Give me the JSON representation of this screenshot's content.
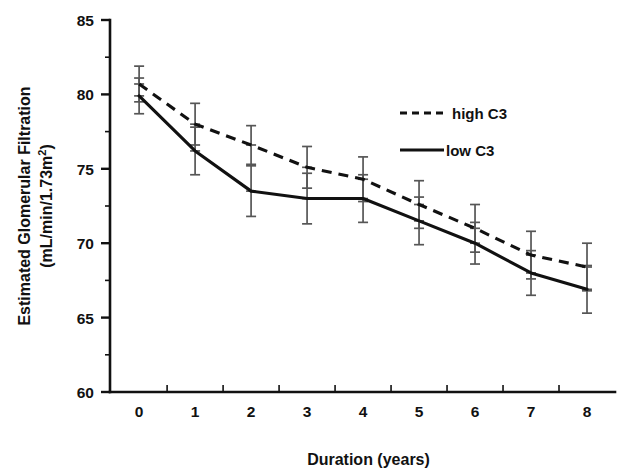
{
  "chart_data": {
    "type": "line",
    "title": "",
    "xlabel": "Duration (years)",
    "ylabel": "Estimated Glomerular Filtration (mL/min/1.73m2)",
    "ylabel_line1": "Estimated Glomerular Filtration",
    "ylabel_line2_prefix": "(mL/min/1.73m",
    "ylabel_line2_sup": "2",
    "ylabel_line2_suffix": ")",
    "x": [
      0,
      1,
      2,
      3,
      4,
      5,
      6,
      7,
      8
    ],
    "xticklabels": [
      "0",
      "1",
      "2",
      "3",
      "4",
      "5",
      "6",
      "7",
      "8"
    ],
    "yticklabels": [
      "85",
      "80",
      "75",
      "70",
      "65",
      "60"
    ],
    "yticks": [
      85,
      80,
      75,
      70,
      65,
      60
    ],
    "xlim": [
      -0.52,
      8.5
    ],
    "ylim": [
      60,
      85
    ],
    "grid": false,
    "legend_position": "upper right",
    "series": [
      {
        "name": "high C3",
        "style": "dashed",
        "color": "#111111",
        "values": [
          80.7,
          78.0,
          76.6,
          75.1,
          74.3,
          72.6,
          71.0,
          69.2,
          68.4
        ],
        "err_upper": [
          81.9,
          79.4,
          77.9,
          76.5,
          75.8,
          74.2,
          72.6,
          70.8,
          70.0
        ],
        "err_lower": [
          79.5,
          76.6,
          75.3,
          73.7,
          72.8,
          71.0,
          69.4,
          67.6,
          66.8
        ]
      },
      {
        "name": "low C3",
        "style": "solid",
        "color": "#111111",
        "values": [
          79.9,
          76.2,
          73.5,
          73.0,
          73.0,
          71.5,
          70.0,
          68.0,
          66.9
        ],
        "err_upper": [
          81.1,
          77.8,
          75.2,
          74.7,
          74.6,
          73.1,
          71.4,
          69.5,
          68.5
        ],
        "err_lower": [
          78.7,
          74.6,
          71.8,
          71.3,
          71.4,
          69.9,
          68.6,
          66.5,
          65.3
        ]
      }
    ]
  },
  "legend": {
    "items": [
      {
        "label": "high C3",
        "style": "dashed"
      },
      {
        "label": "low C3",
        "style": "solid"
      }
    ]
  }
}
